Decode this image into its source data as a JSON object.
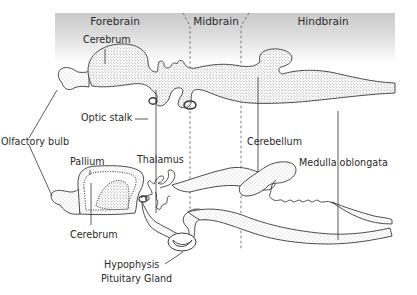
{
  "diagram": {
    "type": "anatomical-diagram",
    "regions": [
      {
        "id": "forebrain",
        "label": "Forebrain"
      },
      {
        "id": "midbrain",
        "label": "Midbrain"
      },
      {
        "id": "hindbrain",
        "label": "Hindbrain"
      }
    ],
    "labels": {
      "cerebrum_top": "Cerebrum",
      "optic_stalk": "Optic stalk",
      "olfactory_bulb": "Olfactory bulb",
      "pallium": "Pallium",
      "thalamus": "Thalamus",
      "cerebrum_bottom": "Cerebrum",
      "hypophysis": "Hypophysis",
      "pituitary_gland": "Pituitary Gland",
      "cerebellum": "Cerebellum",
      "medulla_oblongata": "Medulla oblongata"
    },
    "colors": {
      "header_band_top": "#c9c9c9",
      "header_band_bottom": "#ffffff",
      "outline": "#3a3a3a",
      "stipple": "#8a8a8a",
      "leader_line": "#333333"
    }
  }
}
